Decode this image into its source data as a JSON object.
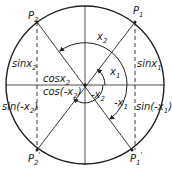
{
  "diagram": {
    "type": "unit-circle-trig-symmetry",
    "center": {
      "x": 85,
      "y": 85
    },
    "radius": 79,
    "colors": {
      "stroke": "#222222",
      "background": "#ffffff"
    },
    "points": {
      "P1": {
        "label": "P",
        "sub": "1",
        "prime": ""
      },
      "P2": {
        "label": "P",
        "sub": "2",
        "prime": ""
      },
      "P1p": {
        "label": "P",
        "sub": "1",
        "prime": "'"
      },
      "P2p": {
        "label": "P",
        "sub": "2",
        "prime": "'"
      }
    },
    "angles": {
      "x1": {
        "label": "x",
        "sub": "1",
        "prefix": ""
      },
      "x2": {
        "label": "x",
        "sub": "2",
        "prefix": ""
      },
      "neg_x1": {
        "label": "x",
        "sub": "1",
        "prefix": "-"
      },
      "neg_x2": {
        "label": "x",
        "sub": "2",
        "prefix": "-"
      }
    },
    "labels": {
      "sin_x1": {
        "fn": "sin",
        "arg": "x",
        "sub": "1"
      },
      "sin_x2": {
        "fn": "sin",
        "arg": "x",
        "sub": "2"
      },
      "cos_x2": {
        "fn": "cos",
        "arg": "x",
        "sub": "2"
      },
      "cos_neg_x2": {
        "fn": "cos(-",
        "arg": "x",
        "sub": "2",
        "close": ")"
      },
      "sin_neg_x2": {
        "fn": "sin(-",
        "arg": "x",
        "sub": "2",
        "close": ")"
      },
      "sin_neg_x1": {
        "fn": "sin(-",
        "arg": "x",
        "sub": "1",
        "close": ")"
      }
    }
  }
}
